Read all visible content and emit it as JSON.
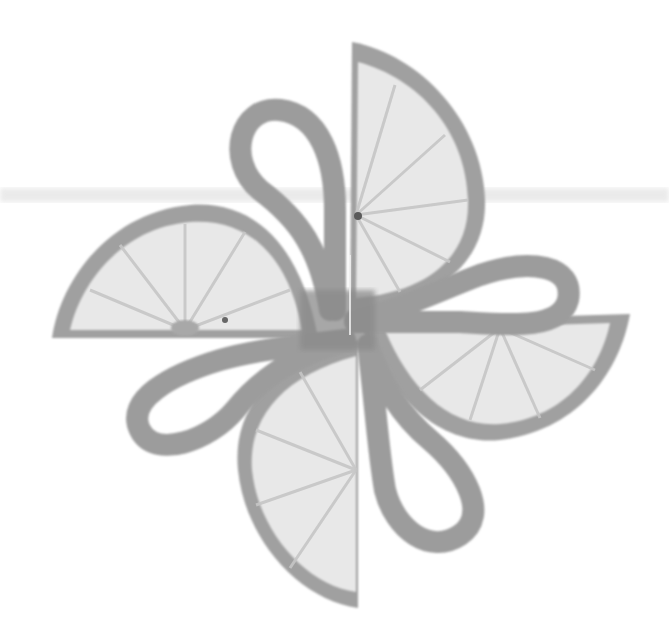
{
  "image": {
    "subject": "Four lemon half-slices arranged in a pinwheel with curled peel loops",
    "style": "grayscale photograph on white background",
    "colors": {
      "background": "#ffffff",
      "rind": "#9a9a9a",
      "rind_dark": "#7f7f7f",
      "pulp": "#e6e6e6",
      "pulp_light": "#efefef",
      "segment_line": "#c4c4c4",
      "peel_loop": "#9b9b9b",
      "scan_band": "#d8d8d8"
    },
    "elements": [
      {
        "name": "lemon-slice-top",
        "position": "upper-center, flat edge on left, rounded side right"
      },
      {
        "name": "lemon-slice-left",
        "position": "left, flat edge on bottom"
      },
      {
        "name": "lemon-slice-right",
        "position": "right, flat edge on top"
      },
      {
        "name": "lemon-slice-bottom",
        "position": "lower-center, flat edge on right"
      },
      {
        "name": "peel-loop-top",
        "position": "upper-left of center"
      },
      {
        "name": "peel-loop-right",
        "position": "right of center"
      },
      {
        "name": "peel-loop-left",
        "position": "left of center"
      },
      {
        "name": "peel-loop-bottom",
        "position": "lower-right of center"
      }
    ]
  }
}
